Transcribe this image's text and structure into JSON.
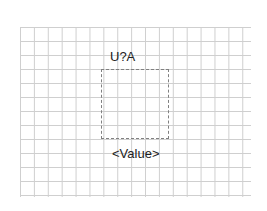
{
  "component": {
    "reference": "U?A",
    "value": "<Value>"
  },
  "colors": {
    "grid": "#cfcfcf",
    "outline": "#808080",
    "text": "#222222"
  }
}
